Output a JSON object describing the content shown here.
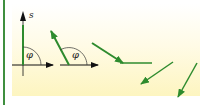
{
  "diagram": {
    "title": "",
    "labels": {
      "vector": "s",
      "angle_1": "φ",
      "angle_2": "φ"
    },
    "colors": {
      "vector": "#2e8b2e",
      "axis": "#111111",
      "border": "#3f8f3f",
      "background_top": "#ffffff",
      "background_bottom": "#fdf5c0"
    },
    "elements": [
      {
        "type": "axis",
        "name": "reference-axis-1",
        "description": "horizontal reference arrow with vertical line"
      },
      {
        "type": "vector",
        "name": "vector-s-vertical",
        "angle_deg": 90
      },
      {
        "type": "angle-arc",
        "name": "angle-phi-1",
        "label": "φ"
      },
      {
        "type": "axis",
        "name": "reference-axis-2"
      },
      {
        "type": "vector",
        "name": "vector-s-tilted",
        "angle_deg": 120
      },
      {
        "type": "angle-arc",
        "name": "angle-phi-2",
        "label": "φ"
      },
      {
        "type": "vector",
        "name": "vector-down-right-1"
      },
      {
        "type": "vector",
        "name": "vector-down-left"
      },
      {
        "type": "vector",
        "name": "vector-down-steep"
      }
    ]
  }
}
